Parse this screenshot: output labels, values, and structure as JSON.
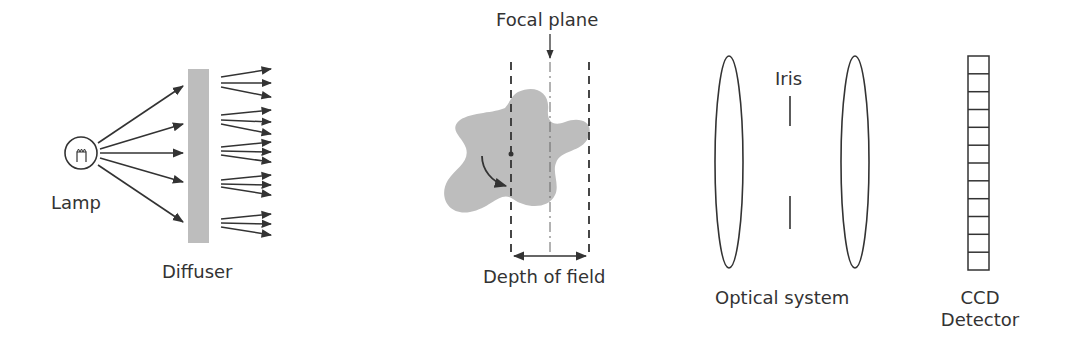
{
  "labels": {
    "lamp": "Lamp",
    "diffuser": "Diffuser",
    "focal_plane": "Focal plane",
    "depth_of_field": "Depth of field",
    "iris": "Iris",
    "optical_system": "Optical system",
    "ccd_line1": "CCD",
    "ccd_line2": "Detector"
  },
  "colors": {
    "stroke": "#333333",
    "fill_gray": "#bdbdbd",
    "background": "#ffffff"
  },
  "ccd": {
    "cells": 12
  },
  "diffuser": {
    "output_fans": 5,
    "arrows_per_fan": 3
  },
  "lamp": {
    "rays": 5
  }
}
